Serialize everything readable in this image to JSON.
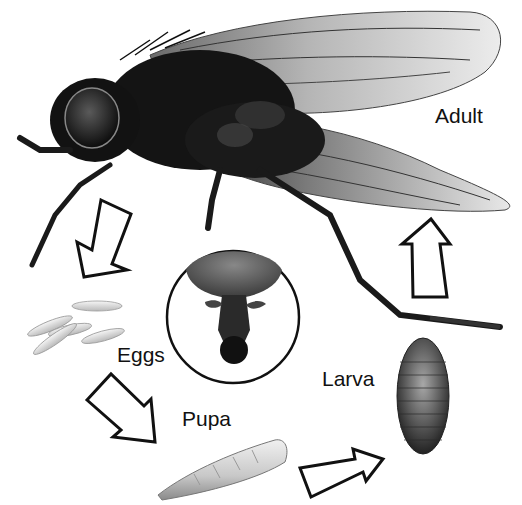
{
  "diagram": {
    "stages": [
      {
        "id": "adult",
        "label": "Adult"
      },
      {
        "id": "eggs",
        "label": "Eggs"
      },
      {
        "id": "pupa",
        "label": "Pupa"
      },
      {
        "id": "larva",
        "label": "Larva"
      }
    ],
    "inset": {
      "description": "magnified head / mouthparts (underside view)"
    },
    "arrows": [
      {
        "from": "adult",
        "to": "eggs",
        "direction": "down-left"
      },
      {
        "from": "eggs",
        "to": "pupa",
        "direction": "down-right"
      },
      {
        "from": "pupa",
        "to": "larva",
        "direction": "right"
      },
      {
        "from": "larva",
        "to": "adult",
        "direction": "up"
      }
    ],
    "colors": {
      "background": "#ffffff",
      "ink": "#111111",
      "fly_body": "#141414",
      "wing": "#cfcfcf",
      "larva_shell": "#4a4a4a",
      "pupa": "#d8d8d8",
      "egg": "#e6e6e6"
    }
  }
}
